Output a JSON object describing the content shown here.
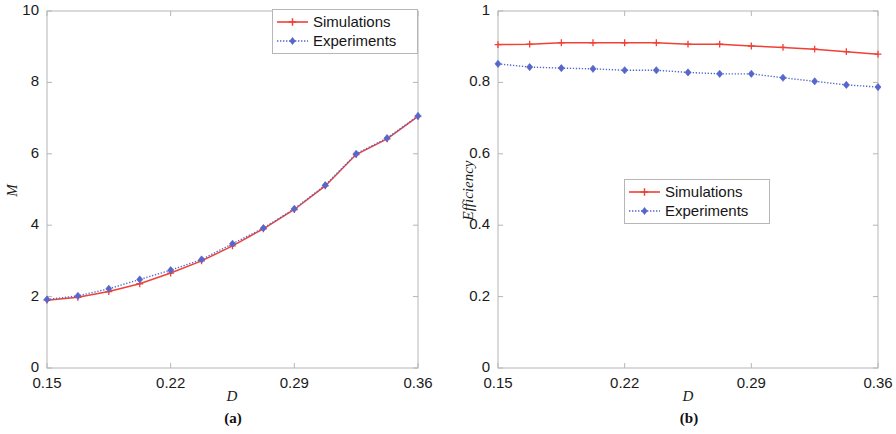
{
  "figure": {
    "background": "#ffffff",
    "series_colors": {
      "simulations": "#ef4136",
      "experiments": "#5566cc"
    },
    "axis_color": "#b6b6b6"
  },
  "panels": [
    {
      "id": "a",
      "caption": "(a)",
      "xlabel": "D",
      "ylabel": "M",
      "xticks": [
        "0.15",
        "0.22",
        "0.29",
        "0.36"
      ],
      "yticks": [
        "0",
        "2",
        "4",
        "6",
        "8",
        "10"
      ],
      "legend": {
        "position": "top-right",
        "entries": [
          "Simulations",
          "Experiments"
        ]
      }
    },
    {
      "id": "b",
      "caption": "(b)",
      "xlabel": "D",
      "ylabel": "Efficiency",
      "xticks": [
        "0.15",
        "0.22",
        "0.29",
        "0.36"
      ],
      "yticks": [
        "0",
        "0.2",
        "0.4",
        "0.6",
        "0.8",
        "1"
      ],
      "legend": {
        "position": "center",
        "entries": [
          "Simulations",
          "Experiments"
        ]
      }
    }
  ],
  "chart_data": [
    {
      "type": "line",
      "panel": "a",
      "title": "",
      "xlabel": "D",
      "ylabel": "M",
      "xlim": [
        0.15,
        0.36
      ],
      "ylim": [
        0,
        10
      ],
      "xticks": [
        0.15,
        0.22,
        0.29,
        0.36
      ],
      "yticks": [
        0,
        2,
        4,
        6,
        8,
        10
      ],
      "grid": false,
      "legend_position": "top-right",
      "x": [
        0.15,
        0.1675,
        0.185,
        0.2025,
        0.22,
        0.2375,
        0.255,
        0.2725,
        0.29,
        0.3075,
        0.325,
        0.3425,
        0.36
      ],
      "series": [
        {
          "name": "Simulations",
          "color": "#ef4136",
          "linestyle": "solid",
          "marker": "plus",
          "values": [
            1.9,
            1.98,
            2.14,
            2.36,
            2.66,
            3.0,
            3.42,
            3.9,
            4.44,
            5.1,
            5.98,
            6.42,
            7.05
          ]
        },
        {
          "name": "Experiments",
          "color": "#5566cc",
          "linestyle": "dotted",
          "marker": "diamond",
          "values": [
            1.92,
            2.02,
            2.22,
            2.48,
            2.74,
            3.04,
            3.48,
            3.92,
            4.46,
            5.12,
            6.0,
            6.44,
            7.06
          ]
        }
      ]
    },
    {
      "type": "line",
      "panel": "b",
      "title": "",
      "xlabel": "D",
      "ylabel": "Efficiency",
      "xlim": [
        0.15,
        0.36
      ],
      "ylim": [
        0,
        1
      ],
      "xticks": [
        0.15,
        0.22,
        0.29,
        0.36
      ],
      "yticks": [
        0,
        0.2,
        0.4,
        0.6,
        0.8,
        1
      ],
      "grid": false,
      "legend_position": "center",
      "x": [
        0.15,
        0.1675,
        0.185,
        0.2025,
        0.22,
        0.2375,
        0.255,
        0.2725,
        0.29,
        0.3075,
        0.325,
        0.3425,
        0.36
      ],
      "series": [
        {
          "name": "Simulations",
          "color": "#ef4136",
          "linestyle": "solid",
          "marker": "plus",
          "values": [
            0.906,
            0.907,
            0.911,
            0.911,
            0.911,
            0.911,
            0.907,
            0.907,
            0.902,
            0.898,
            0.893,
            0.886,
            0.879
          ]
        },
        {
          "name": "Experiments",
          "color": "#5566cc",
          "linestyle": "dotted",
          "marker": "diamond",
          "values": [
            0.852,
            0.843,
            0.84,
            0.838,
            0.834,
            0.834,
            0.828,
            0.824,
            0.824,
            0.813,
            0.803,
            0.793,
            0.787
          ]
        }
      ]
    }
  ]
}
